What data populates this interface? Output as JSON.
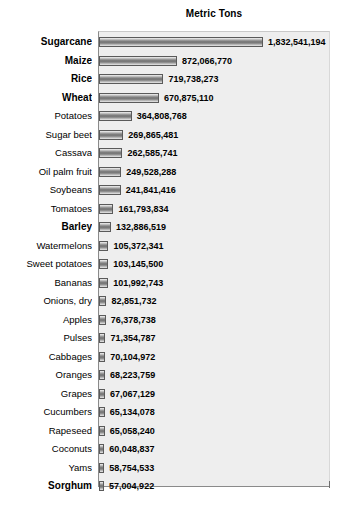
{
  "chart_data": {
    "type": "bar",
    "orientation": "horizontal",
    "title": "Metric Tons",
    "xlabel": "",
    "ylabel": "",
    "grid": false,
    "legend": false,
    "xlim": [
      0,
      1832541194
    ],
    "categories": [
      "Sugarcane",
      "Maize",
      "Rice",
      "Wheat",
      "Potatoes",
      "Sugar beet",
      "Cassava",
      "Oil palm fruit",
      "Soybeans",
      "Tomatoes",
      "Barley",
      "Watermelons",
      "Sweet potatoes",
      "Bananas",
      "Onions, dry",
      "Apples",
      "Pulses",
      "Cabbages",
      "Oranges",
      "Grapes",
      "Cucumbers",
      "Rapeseed",
      "Coconuts",
      "Yams",
      "Sorghum"
    ],
    "values": [
      1832541194,
      872066770,
      719738273,
      670875110,
      364808768,
      269865481,
      262585741,
      249528288,
      241841416,
      161793834,
      132886519,
      105372341,
      103145500,
      101992743,
      82851732,
      76378738,
      71354787,
      70104972,
      68223759,
      67067129,
      65134078,
      65058240,
      60048837,
      58754533,
      57004922
    ],
    "value_labels": [
      "1,832,541,194",
      "872,066,770",
      "719,738,273",
      "670,875,110",
      "364,808,768",
      "269,865,481",
      "262,585,741",
      "249,528,288",
      "241,841,416",
      "161,793,834",
      "132,886,519",
      "105,372,341",
      "103,145,500",
      "101,992,743",
      "82,851,732",
      "76,378,738",
      "71,354,787",
      "70,104,972",
      "68,223,759",
      "67,067,129",
      "65,134,078",
      "65,058,240",
      "60,048,837",
      "58,754,533",
      "57,004,922"
    ],
    "bold_categories": [
      "Sugarcane",
      "Maize",
      "Rice",
      "Wheat",
      "Barley",
      "Sorghum"
    ],
    "colors": {
      "plot_background": "#eeeeee",
      "page_background": "#ffffff",
      "bar_fill_dark": "#6f6f6f",
      "bar_fill_light": "#f2f2f2",
      "bar_border": "#5a5a5a",
      "text": "#000000",
      "axis_line": "#8a8a8a"
    }
  }
}
